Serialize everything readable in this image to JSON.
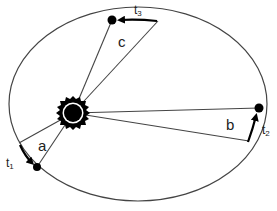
{
  "diagram": {
    "labels": {
      "area_a": "a",
      "area_b": "b",
      "area_c": "c",
      "t1": "t",
      "t1_sub": "1",
      "t2": "t",
      "t2_sub": "2",
      "t3": "t",
      "t3_sub": "3"
    },
    "colors": {
      "line": "#333333",
      "fill": "#000000",
      "background": "#ffffff"
    }
  }
}
